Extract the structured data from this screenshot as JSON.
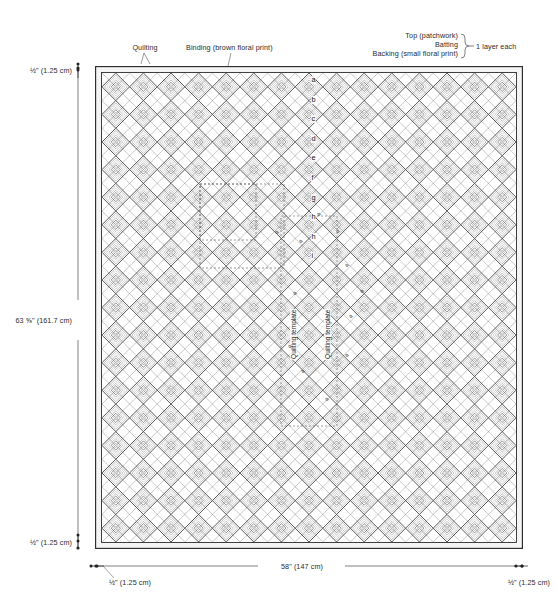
{
  "figure": {
    "type": "quilt-construction-diagram"
  },
  "annotations": {
    "quilting": "Quilting",
    "binding": "Binding (brown floral print)",
    "layers": {
      "top": "Top (patchwork)",
      "batting": "Batting",
      "backing": "Backing (small floral print)",
      "brace_note": "1 layer each"
    },
    "template_left": "Quilting template",
    "template_right": "Quilting template"
  },
  "dimensions": {
    "top_left_seam": "½\" (1.25 cm)",
    "bottom_left_seam": "½\" (1.25 cm)",
    "height": "63 ⅝\" (161.7 cm)",
    "width": "58\" (147 cm)",
    "bottom_left_margin": "½\" (1.25 cm)",
    "bottom_right_margin": "½\" (1.25 cm)"
  },
  "center_letters": [
    "a",
    "b",
    "c",
    "d",
    "e",
    "f",
    "g",
    "h"
  ],
  "scatter_letters": [
    {
      "ch": "a",
      "x": 336,
      "y": 228
    },
    {
      "ch": "a",
      "x": 345,
      "y": 262
    },
    {
      "ch": "a",
      "x": 349,
      "y": 313
    },
    {
      "ch": "a",
      "x": 345,
      "y": 352
    },
    {
      "ch": "a",
      "x": 299,
      "y": 238
    },
    {
      "ch": "a",
      "x": 293,
      "y": 290
    },
    {
      "ch": "a",
      "x": 288,
      "y": 343
    },
    {
      "ch": "a",
      "x": 301,
      "y": 368
    },
    {
      "ch": "a",
      "x": 325,
      "y": 396
    },
    {
      "ch": "a",
      "x": 275,
      "y": 229
    },
    {
      "ch": "a",
      "x": 360,
      "y": 288
    },
    {
      "ch": "a",
      "x": 317,
      "y": 211
    }
  ],
  "colors": {
    "line": "#2b2b2b",
    "pattern_light": "#b9b9b9",
    "pattern_mid": "#8f8f8f",
    "pattern_dark": "#3a3a3a",
    "background": "#ffffff",
    "dash": "#555555"
  },
  "chart_data": {
    "type": "diagram",
    "finished_width_in": 58,
    "finished_width_cm": 147,
    "finished_height_in": 63.625,
    "finished_height_cm": 161.7,
    "seam_allowance_in": 0.5,
    "seam_allowance_cm": 1.25,
    "grid_columns": 15,
    "grid_rows": 17,
    "layers": [
      "Top (patchwork)",
      "Batting",
      "Backing (small floral print)"
    ],
    "layer_count_each": 1
  }
}
